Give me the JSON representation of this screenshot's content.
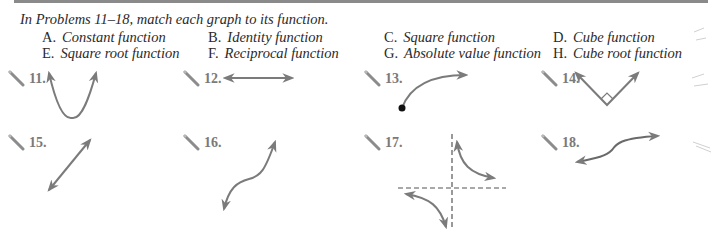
{
  "instructions": "In Problems 11–18, match each graph to its function.",
  "choices": [
    {
      "letter": "A.",
      "label": "Constant function"
    },
    {
      "letter": "B.",
      "label": "Identity function"
    },
    {
      "letter": "C.",
      "label": "Square function"
    },
    {
      "letter": "D.",
      "label": "Cube function"
    },
    {
      "letter": "E.",
      "label": "Square root function"
    },
    {
      "letter": "F.",
      "label": "Reciprocal function"
    },
    {
      "letter": "G.",
      "label": "Absolute value function"
    },
    {
      "letter": "H.",
      "label": "Cube root function"
    }
  ],
  "problems": [
    {
      "number": "11.",
      "graph": "parabola-up",
      "icon": "pencil-icon"
    },
    {
      "number": "12.",
      "graph": "horizontal-line",
      "icon": "pencil-icon"
    },
    {
      "number": "13.",
      "graph": "square-root-curve",
      "icon": "pencil-icon"
    },
    {
      "number": "14.",
      "graph": "absolute-value-v",
      "icon": "pencil-icon"
    },
    {
      "number": "15.",
      "graph": "diagonal-line",
      "icon": "pencil-icon"
    },
    {
      "number": "16.",
      "graph": "cubic-curve",
      "icon": "pencil-icon"
    },
    {
      "number": "17.",
      "graph": "reciprocal-hyperbola",
      "icon": "pencil-icon"
    },
    {
      "number": "18.",
      "graph": "cube-root-curve",
      "icon": "pencil-icon"
    }
  ],
  "colors": {
    "curve": "#7b7b7b",
    "text": "#2a2a2a",
    "number": "#7a7a7a",
    "rule": "#8a8a8a",
    "asymptote": "#555555"
  }
}
